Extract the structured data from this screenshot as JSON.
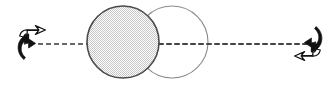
{
  "figure": {
    "name": "rotating-sphere-about-axis-diagram",
    "caption": "",
    "width": 336,
    "height": 92,
    "background": "#ffffff"
  },
  "colors": {
    "background": "#ffffff",
    "axis_line": "#3a3a3a",
    "shaded_circle_fill": "#dcdcdc",
    "shaded_circle_stroke": "#4a4a4a",
    "open_circle_fill": "#ffffff",
    "open_circle_stroke": "#8a8a8a",
    "arrow_solid": "#111111",
    "arrow_hollow_fill": "#ffffff",
    "arrow_hollow_stroke": "#111111"
  },
  "axis": {
    "label": "",
    "name": "rotation-axis",
    "style": "dashed",
    "y": 44,
    "x_start": 38,
    "x_end": 312,
    "dash_length": 5,
    "gap_length": 3,
    "stroke_width": 1.4
  },
  "shapes": [
    {
      "name": "shaded-circle",
      "role": "initial-position-sphere",
      "cx": 123,
      "cy": 42,
      "r": 36,
      "fill": "#dcdcdc",
      "stroke": "#4a4a4a",
      "stroke_width": 1.6,
      "label": ""
    },
    {
      "name": "open-circle",
      "role": "rotated-position-sphere",
      "cx": 172,
      "cy": 42,
      "r": 36,
      "fill": "none",
      "stroke": "#8a8a8a",
      "stroke_width": 1.1,
      "label": ""
    }
  ],
  "arrows": [
    {
      "name": "left-rotation-arrow",
      "role": "rotation-direction-indicator-left",
      "cx": 26,
      "cy": 43,
      "rotation_deg": 0,
      "label": ""
    },
    {
      "name": "right-rotation-arrow",
      "role": "rotation-direction-indicator-right",
      "cx": 314,
      "cy": 43,
      "rotation_deg": 180,
      "label": ""
    }
  ],
  "annotations": []
}
